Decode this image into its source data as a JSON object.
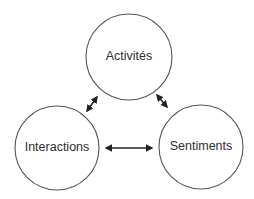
{
  "diagram": {
    "line_color": "#555555",
    "arrow_color": "#222222",
    "text_color": "#2e2e2e",
    "nodes": [
      {
        "id": "activites",
        "label": "Activités",
        "cx": 129,
        "cy": 57,
        "r": 43
      },
      {
        "id": "interactions",
        "label": "Interactions",
        "cx": 57,
        "cy": 148,
        "r": 42
      },
      {
        "id": "sentiments",
        "label": "Sentiments",
        "cx": 201,
        "cy": 147,
        "r": 42
      }
    ],
    "edges": [
      {
        "from": "activites",
        "to": "interactions",
        "type": "bidirectional",
        "x1": 97,
        "y1": 97,
        "x2": 87,
        "y2": 111
      },
      {
        "from": "activites",
        "to": "sentiments",
        "type": "bidirectional",
        "x1": 157,
        "y1": 95,
        "x2": 167,
        "y2": 107
      },
      {
        "from": "interactions",
        "to": "sentiments",
        "type": "bidirectional",
        "x1": 105,
        "y1": 148,
        "x2": 153,
        "y2": 148
      }
    ]
  }
}
